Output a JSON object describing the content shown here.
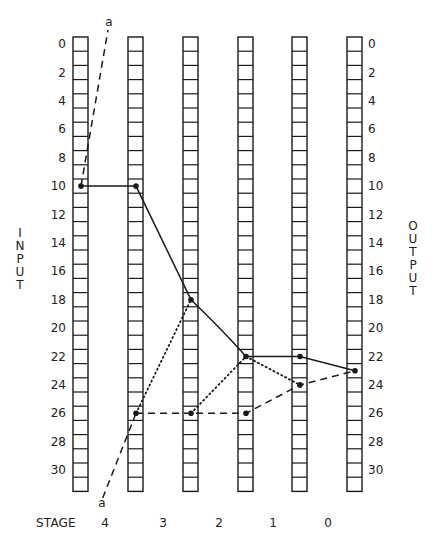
{
  "diagram": {
    "title": "",
    "axis_left_label": "INPUT",
    "axis_right_label": "OUTPUT",
    "stage_title": "STAGE",
    "stages": [
      "4",
      "3",
      "2",
      "1",
      "0"
    ],
    "row_tick_labels": [
      "0",
      "2",
      "4",
      "6",
      "8",
      "10",
      "12",
      "14",
      "16",
      "18",
      "20",
      "22",
      "24",
      "26",
      "28",
      "30"
    ],
    "cells_per_column": 32,
    "column_count": 6,
    "marker_label_top": "a",
    "marker_label_bottom": "a",
    "line_color": "#1a1a1a",
    "background_color": "#ffffff"
  },
  "chart_data": {
    "type": "diagram",
    "columns": [
      "input",
      "stage-4/3 boundary",
      "stage-3/2 boundary",
      "stage-2/1 boundary",
      "stage-1/0 boundary",
      "output"
    ],
    "paths": [
      {
        "name": "solid-path",
        "style": "solid",
        "points": [
          [
            0,
            10
          ],
          [
            1,
            10
          ],
          [
            2,
            18
          ],
          [
            3,
            22
          ],
          [
            4,
            22
          ],
          [
            5,
            23
          ]
        ]
      },
      {
        "name": "dotted-path-1",
        "style": "dotted",
        "points": [
          [
            1,
            26
          ],
          [
            2,
            18
          ]
        ]
      },
      {
        "name": "dotted-path-2",
        "style": "dotted",
        "points": [
          [
            2,
            26
          ],
          [
            3,
            22
          ],
          [
            4,
            24
          ]
        ]
      },
      {
        "name": "dashed-path",
        "style": "dashed",
        "points": [
          [
            1,
            26
          ],
          [
            2,
            26
          ],
          [
            3,
            26
          ],
          [
            4,
            24
          ],
          [
            5,
            23
          ]
        ]
      },
      {
        "name": "a-line-top",
        "style": "dashed",
        "label": "a",
        "points": [
          [
            0,
            10
          ],
          [
            0.5,
            -1
          ]
        ]
      },
      {
        "name": "a-line-bottom",
        "style": "dashed",
        "label": "a",
        "points": [
          [
            1,
            26
          ],
          [
            0.4,
            32
          ]
        ]
      }
    ],
    "xlabel": "STAGE",
    "ylabel_left": "INPUT",
    "ylabel_right": "OUTPUT",
    "ylim": [
      0,
      31
    ]
  }
}
